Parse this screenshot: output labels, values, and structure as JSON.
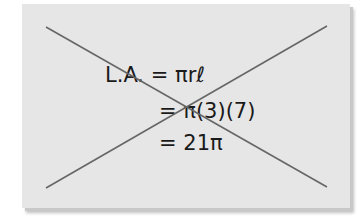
{
  "card": {
    "background": "#e6e6e6",
    "crossed_out": true,
    "cross_color": "#666666"
  },
  "equation": {
    "lines": [
      "L.A. = πrℓ",
      "= π(3)(7)",
      "= 21π"
    ]
  }
}
